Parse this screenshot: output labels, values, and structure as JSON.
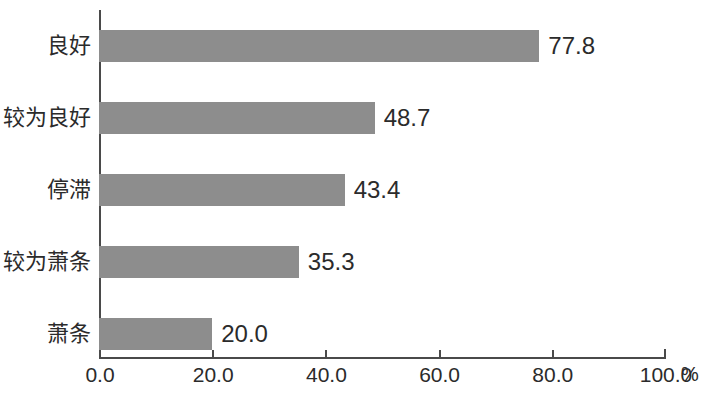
{
  "chart_data": {
    "type": "bar",
    "orientation": "horizontal",
    "title": "",
    "subtitle": "",
    "xlabel": "%",
    "ylabel": "",
    "categories": [
      "良好",
      "较为良好",
      "停滞",
      "较为萧条",
      "萧条"
    ],
    "values": [
      77.8,
      48.7,
      43.4,
      35.3,
      20.0
    ],
    "value_labels": [
      "77.8",
      "48.7",
      "43.4",
      "35.3",
      "20.0"
    ],
    "xlim": [
      0,
      100
    ],
    "xticks": [
      0,
      20,
      40,
      60,
      80,
      100
    ],
    "xtick_labels": [
      "0.0",
      "20.0",
      "40.0",
      "60.0",
      "80.0",
      "100.0"
    ],
    "axis_unit": "%",
    "grid": false,
    "legend": false,
    "series": [
      {
        "name": "",
        "values": [
          77.8,
          48.7,
          43.4,
          35.3,
          20.0
        ]
      }
    ],
    "colors": {
      "bar": "#8d8d8d",
      "axis": "#4a4a4a",
      "text": "#2b2b2b",
      "background": "#ffffff"
    }
  }
}
